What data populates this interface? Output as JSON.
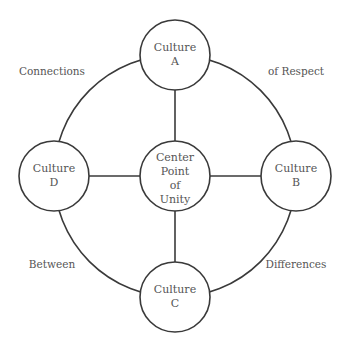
{
  "diagram": {
    "title": "",
    "stroke_color": "#3a3a3a",
    "text_color": "#555555",
    "center": {
      "id": "center",
      "lines": [
        "Center",
        "Point",
        "of",
        "Unity"
      ]
    },
    "nodes": [
      {
        "id": "A",
        "position": "top",
        "lines": [
          "Culture",
          "A"
        ]
      },
      {
        "id": "B",
        "position": "right",
        "lines": [
          "Culture",
          "B"
        ]
      },
      {
        "id": "C",
        "position": "bottom",
        "lines": [
          "Culture",
          "C"
        ]
      },
      {
        "id": "D",
        "position": "left",
        "lines": [
          "Culture",
          "D"
        ]
      }
    ],
    "edges": [
      {
        "from": "center",
        "to": "A",
        "type": "spoke"
      },
      {
        "from": "center",
        "to": "B",
        "type": "spoke"
      },
      {
        "from": "center",
        "to": "C",
        "type": "spoke"
      },
      {
        "from": "center",
        "to": "D",
        "type": "spoke"
      },
      {
        "from": "A",
        "to": "B",
        "type": "arc"
      },
      {
        "from": "B",
        "to": "C",
        "type": "arc"
      },
      {
        "from": "C",
        "to": "D",
        "type": "arc"
      },
      {
        "from": "D",
        "to": "A",
        "type": "arc"
      }
    ],
    "quadrant_labels": [
      {
        "quadrant": "top-left",
        "text": "Connections"
      },
      {
        "quadrant": "top-right",
        "text": "of Respect"
      },
      {
        "quadrant": "bottom-left",
        "text": "Between"
      },
      {
        "quadrant": "bottom-right",
        "text": "Differences"
      }
    ]
  }
}
